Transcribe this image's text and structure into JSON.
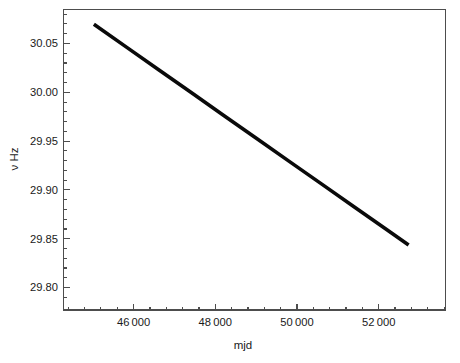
{
  "figure": {
    "background_color": "#ffffff",
    "frame_color": "#4d4d4d",
    "line_color": "#0a0a0a"
  },
  "chart_data": {
    "type": "line",
    "title": "",
    "subtitle": "",
    "xlabel": "mjd",
    "ylabel": "ν Hz",
    "xlim": [
      44300,
      53100
    ],
    "ylim": [
      29.775,
      30.073
    ],
    "grid": false,
    "legend": null,
    "x_ticks": [
      46000,
      48000,
      50000,
      52000
    ],
    "x_tick_labels": [
      "46 000",
      "48 000",
      "50 000",
      "52 000"
    ],
    "y_ticks": [
      29.8,
      29.85,
      29.9,
      29.95,
      30.0,
      30.05
    ],
    "y_tick_labels": [
      "29.80",
      "29.85",
      "29.90",
      "29.95",
      "30.00",
      "30.05"
    ],
    "series": [
      {
        "name": "spin frequency",
        "x": [
          45000,
          45750,
          46500,
          47250,
          48000,
          48750,
          49500,
          50250,
          51000,
          51750,
          52250
        ],
        "y": [
          30.0583,
          30.0357,
          30.013,
          29.9904,
          29.9677,
          29.9451,
          29.9224,
          29.8998,
          29.8771,
          29.8545,
          29.8394
        ]
      }
    ],
    "annotations": []
  },
  "axes": {
    "x_axis_name": "mjd-axis",
    "y_axis_name": "nu-hz-axis"
  }
}
